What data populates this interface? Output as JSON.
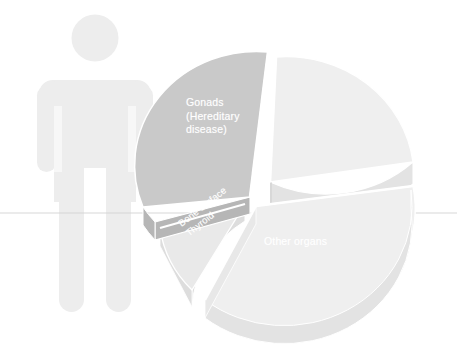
{
  "figure": {
    "type": "exploded-3d-pie",
    "background_color": "#ffffff",
    "pictogram": {
      "name": "human-figure",
      "color": "#ededed"
    },
    "guide_line": {
      "color": "#d2d2d2",
      "y": 213
    }
  },
  "chart_data": {
    "type": "pie",
    "title": "",
    "subtitle": "",
    "xlabel": "",
    "ylabel": "",
    "exploded": true,
    "three_d": true,
    "legend_position": "none",
    "grid": false,
    "labels_inside": true,
    "categories": [
      "Gonads\n(Hereditary\ndisease)",
      "Other organs",
      "Bone surface\nThyroid"
    ],
    "series": [
      {
        "name": "Radiation dose distribution by organ",
        "values": [
          32,
          46,
          22
        ]
      }
    ],
    "slices": [
      {
        "id": "gonads",
        "label": "Gonads\n(Hereditary\ndisease)",
        "label_line_1": "Gonads",
        "label_line_2": "(Hereditary",
        "label_line_3": "disease)",
        "value": 32,
        "start_angle_deg": 183,
        "end_angle_deg": 298,
        "top_color": "#c9c9c9",
        "side_color": "#b6b6b6",
        "explode": 6
      },
      {
        "id": "other-organs",
        "label": "Other organs",
        "value": 46,
        "start_angle_deg": 300,
        "end_angle_deg": 118,
        "top_color": "#efefef",
        "side_color": "#e3e3e3",
        "explode": 5
      },
      {
        "id": "bone-surface-thyroid",
        "label": "Bone surface\nThyroid",
        "label_line_1": "Bone surface",
        "label_line_2": "Thyroid",
        "value": 22,
        "start_angle_deg": 120,
        "end_angle_deg": 181,
        "top_color": "#e9e9e9",
        "side_color": "#dddddd",
        "explode": 6
      }
    ]
  }
}
